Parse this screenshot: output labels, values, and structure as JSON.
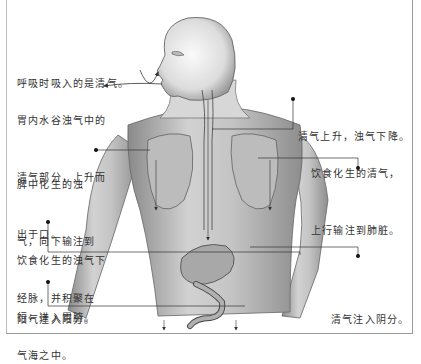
{
  "diagram": {
    "type": "anatomical illustration",
    "labels": [
      {
        "id": "inhale",
        "lines": [
          "呼吸时吸入的是清气。"
        ]
      },
      {
        "id": "stomach-clear",
        "lines": [
          "胃内水谷浊气中的",
          "清气部分，上升而",
          "出于口。"
        ]
      },
      {
        "id": "spleen-turbid",
        "lines": [
          "脾中化生的浊",
          "气，向下输注到",
          "经脉，并积聚在",
          "气海之中。"
        ]
      },
      {
        "id": "food-turbid",
        "lines": [
          "饮食化生的浊气下",
          "行，进入胃腑。"
        ]
      },
      {
        "id": "yang-qi",
        "lines": [
          "阳气注入阳分。"
        ]
      },
      {
        "id": "clear-rise",
        "lines": [
          "清气上升，浊气下降。"
        ]
      },
      {
        "id": "food-clear",
        "lines": [
          "饮食化生的清气，",
          "上行输注到肺脏。"
        ]
      },
      {
        "id": "clear-yin",
        "lines": [
          "清气注入阴分。"
        ]
      }
    ]
  }
}
